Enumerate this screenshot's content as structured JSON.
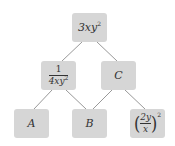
{
  "diagram": {
    "type": "tree",
    "box_color": "#d6d6d6",
    "line_color": "#999999",
    "nodes": {
      "root": {
        "label": "3xy",
        "exp": "2"
      },
      "left_mid": {
        "num": "1",
        "den": "4xy",
        "den_exp": "2"
      },
      "right_mid": {
        "label": "C"
      },
      "bottom_a": {
        "label": "A"
      },
      "bottom_b": {
        "label": "B"
      },
      "bottom_c": {
        "num": "2y",
        "den": "x",
        "open": "(",
        "close": ")",
        "exp": "2"
      }
    },
    "edges": [
      [
        "root",
        "left_mid"
      ],
      [
        "root",
        "right_mid"
      ],
      [
        "left_mid",
        "bottom_a"
      ],
      [
        "left_mid",
        "bottom_b"
      ],
      [
        "right_mid",
        "bottom_b"
      ],
      [
        "right_mid",
        "bottom_c"
      ]
    ]
  }
}
